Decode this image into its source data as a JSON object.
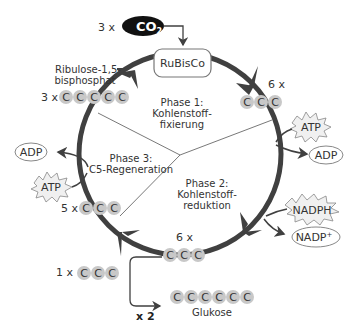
{
  "diagram": {
    "colors": {
      "cycle": "#404040",
      "carbon_fill": "#c8c8c8",
      "co2_fill": "#111111",
      "thin_line": "#555555"
    },
    "co2": {
      "count": "3 x",
      "label": "CO",
      "subscript": "2"
    },
    "enzyme": {
      "label": "RuBisCo"
    },
    "ribulose": {
      "name_line1": "Ribulose-1,5-",
      "name_line2": "bisphosphat",
      "count": "3 x",
      "carbons": [
        "C",
        "C",
        "C",
        "C",
        "C"
      ]
    },
    "phase1": {
      "title": "Phase 1:",
      "line2": "Kohlenstoff-",
      "line3": "fixierung",
      "count": "6 x",
      "carbons": [
        "C",
        "C",
        "C"
      ]
    },
    "phase2": {
      "title": "Phase 2:",
      "line2": "Kohlenstoff-",
      "line3": "reduktion",
      "count": "6 x",
      "carbons": [
        "C",
        "C",
        "C"
      ]
    },
    "phase3": {
      "title": "Phase 3:",
      "line2": "C5-Regeneration",
      "count": "5 x",
      "carbons": [
        "C",
        "C",
        "C"
      ]
    },
    "energy_right_top": {
      "in": "ATP",
      "out": "ADP"
    },
    "energy_right_bottom": {
      "in": "NADPH",
      "out": "NADP",
      "out_sup": "+"
    },
    "energy_left": {
      "in": "ATP",
      "out": "ADP"
    },
    "output": {
      "count": "1 x",
      "carbons": [
        "C",
        "C",
        "C"
      ],
      "multiplier": "x 2",
      "glucose_carbons": [
        "C",
        "C",
        "C",
        "C",
        "C",
        "C"
      ],
      "glucose_label": "Glukose"
    }
  }
}
